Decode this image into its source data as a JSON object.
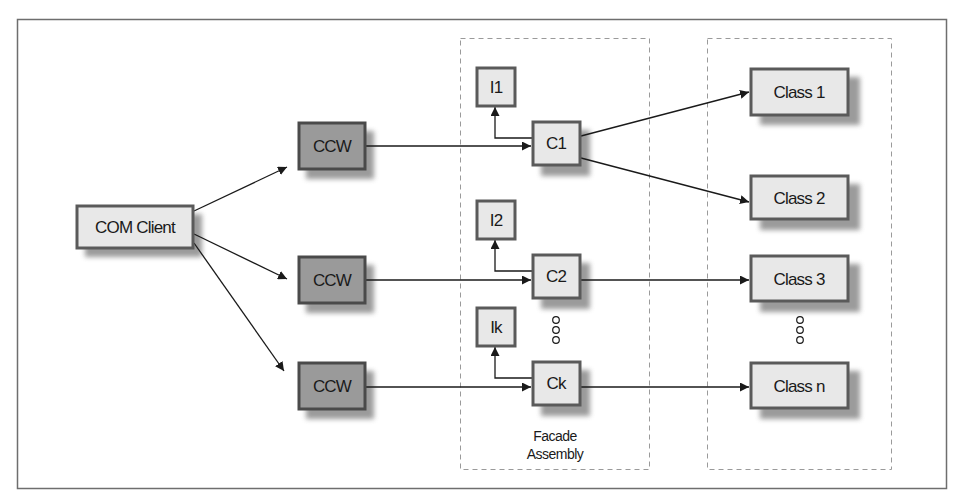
{
  "diagram": {
    "title": "",
    "colors": {
      "frame": "#6e6e6e",
      "box_border": "#5a5a5a",
      "box_fill_light": "#e8e8e8",
      "box_fill_dark": "#9a9a9a",
      "shadow": "#8a8a8a",
      "dashed": "#9a9a9a",
      "line": "#1a1a1a"
    },
    "client": {
      "label": "COM Client"
    },
    "wrappers": [
      {
        "label": "CCW"
      },
      {
        "label": "CCW"
      },
      {
        "label": "CCW"
      }
    ],
    "facade": {
      "caption_line1": "Facade",
      "caption_line2": "Assembly",
      "interfaces": [
        {
          "label": "I1"
        },
        {
          "label": "I2"
        },
        {
          "label": "Ik"
        }
      ],
      "classes": [
        {
          "label": "C1"
        },
        {
          "label": "C2"
        },
        {
          "label": "Ck"
        }
      ]
    },
    "targets": {
      "classes": [
        {
          "label": "Class 1"
        },
        {
          "label": "Class 2"
        },
        {
          "label": "Class 3"
        },
        {
          "label": "Class n"
        }
      ]
    },
    "ellipsis_symbol": "ooo",
    "edges": [
      {
        "from": "COM Client",
        "to": "CCW (1)"
      },
      {
        "from": "COM Client",
        "to": "CCW (2)"
      },
      {
        "from": "COM Client",
        "to": "CCW (3)"
      },
      {
        "from": "CCW (1)",
        "to": "C1"
      },
      {
        "from": "CCW (2)",
        "to": "C2"
      },
      {
        "from": "CCW (3)",
        "to": "Ck"
      },
      {
        "from": "C1",
        "to": "I1"
      },
      {
        "from": "C2",
        "to": "I2"
      },
      {
        "from": "Ck",
        "to": "Ik"
      },
      {
        "from": "C1",
        "to": "Class 1"
      },
      {
        "from": "C1",
        "to": "Class 2"
      },
      {
        "from": "C2",
        "to": "Class 3"
      },
      {
        "from": "Ck",
        "to": "Class n"
      }
    ]
  }
}
